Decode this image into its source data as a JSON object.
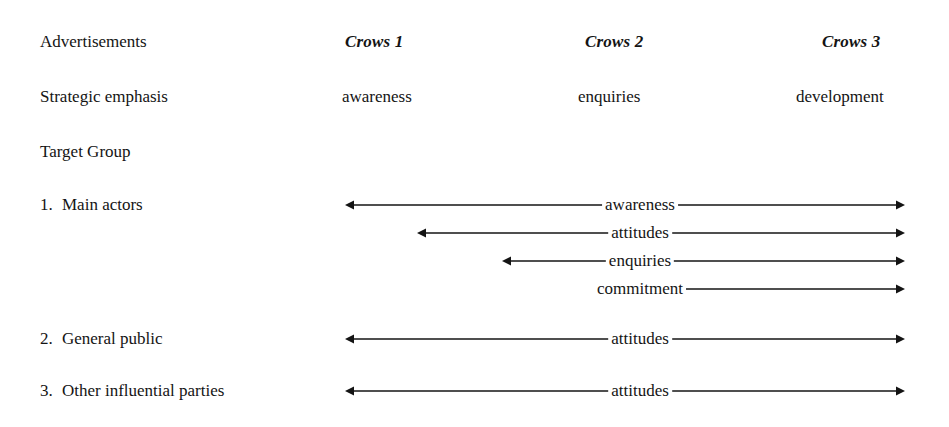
{
  "page": {
    "width": 949,
    "height": 427,
    "background": "#ffffff",
    "ink": "#141414"
  },
  "table": {
    "row_header_labels": {
      "advertisements": "Advertisements",
      "strategic_emphasis": "Strategic emphasis",
      "target_group": "Target Group"
    },
    "columns": [
      {
        "name": "Crows 1",
        "strategic_emphasis": "awareness"
      },
      {
        "name": "Crows 2",
        "strategic_emphasis": "enquiries"
      },
      {
        "name": "Crows 3",
        "strategic_emphasis": "development"
      }
    ],
    "target_groups": [
      {
        "number": "1.",
        "label": "Main actors"
      },
      {
        "number": "2.",
        "label": "General public"
      },
      {
        "number": "3.",
        "label": "Other influential parties"
      }
    ]
  },
  "arrows": [
    {
      "label": "awareness",
      "group": "Main actors",
      "start_x": 345,
      "end_x": 905,
      "y": 205
    },
    {
      "label": "attitudes",
      "group": "Main actors",
      "start_x": 417,
      "end_x": 905,
      "y": 233
    },
    {
      "label": "enquiries",
      "group": "Main actors",
      "start_x": 502,
      "end_x": 905,
      "y": 261
    },
    {
      "label": "commitment",
      "group": "Main actors",
      "start_x": 607,
      "end_x": 905,
      "y": 289
    },
    {
      "label": "attitudes",
      "group": "General public",
      "start_x": 345,
      "end_x": 905,
      "y": 339
    },
    {
      "label": "attitudes",
      "group": "Other influential parties",
      "start_x": 345,
      "end_x": 905,
      "y": 391
    }
  ]
}
